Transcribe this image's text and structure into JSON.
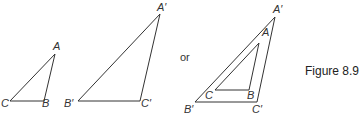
{
  "figure": {
    "caption": "Figure 8.9",
    "connector_text": "or",
    "stroke_color": "#333333"
  },
  "left_pair": {
    "small_triangle": {
      "vertices": {
        "A": [
          55,
          54
        ],
        "B": [
          44,
          101
        ],
        "C": [
          10,
          101
        ]
      },
      "labels": {
        "A": "A",
        "B": "B",
        "C": "C"
      }
    },
    "large_triangle": {
      "vertices": {
        "A'": [
          160,
          14
        ],
        "B'": [
          78,
          101
        ],
        "C'": [
          140,
          101
        ]
      },
      "labels": {
        "A_prime": "A′",
        "B_prime": "B′",
        "C_prime": "C′"
      }
    }
  },
  "right_overlay": {
    "outer_triangle": {
      "vertices": {
        "A'": [
          275,
          17
        ],
        "B'": [
          195,
          102
        ],
        "C'": [
          257,
          102
        ]
      },
      "labels": {
        "A_prime": "A′",
        "B_prime": "B′",
        "C_prime": "C′"
      }
    },
    "inner_triangle": {
      "vertices": {
        "A": [
          259,
          43
        ],
        "B": [
          249,
          90
        ],
        "C": [
          215,
          90
        ]
      },
      "labels": {
        "A": "A",
        "B": "B",
        "C": "C"
      }
    }
  }
}
